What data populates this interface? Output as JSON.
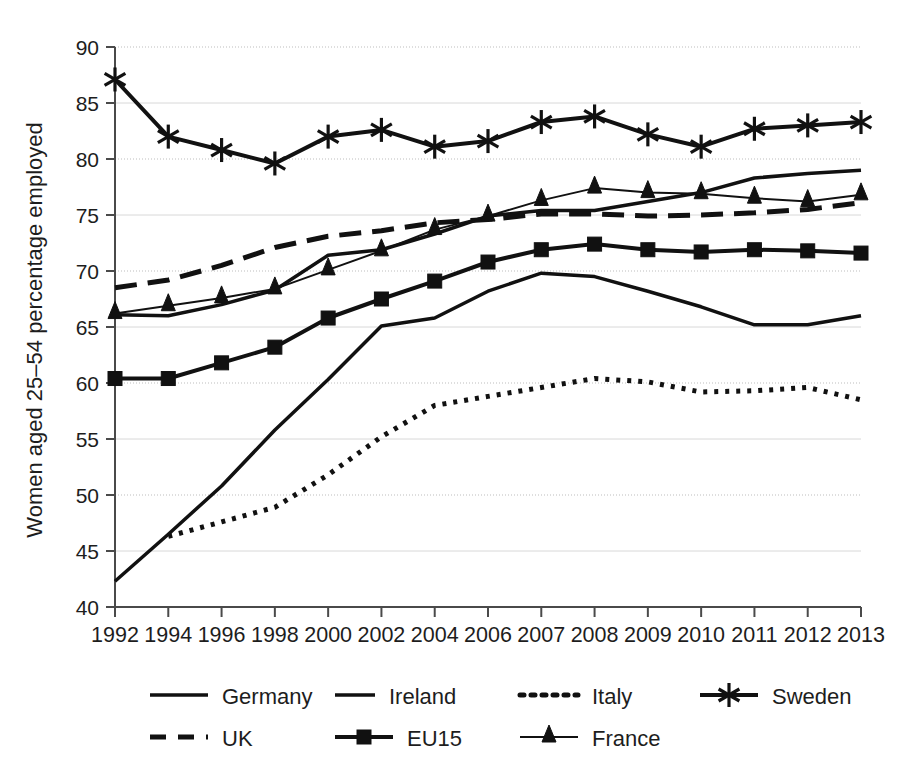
{
  "chart_data": {
    "type": "line",
    "title": "",
    "xlabel": "",
    "ylabel": "Women aged 25–54  percentage employed",
    "ylim": [
      40,
      90
    ],
    "ytick_step": 5,
    "yticks": [
      40,
      45,
      50,
      55,
      60,
      65,
      70,
      75,
      80,
      85,
      90
    ],
    "grid": true,
    "legend_position": "bottom",
    "categories": [
      "1992",
      "1994",
      "1996",
      "1998",
      "2000",
      "2002",
      "2004",
      "2006",
      "2007",
      "2008",
      "2009",
      "2010",
      "2011",
      "2012",
      "2013"
    ],
    "series": [
      {
        "name": "Germany",
        "style": "solid",
        "marker": "none",
        "values": [
          66.1,
          66.0,
          67.0,
          68.3,
          71.4,
          71.9,
          73.3,
          74.9,
          75.4,
          75.4,
          76.2,
          77.0,
          78.3,
          78.7,
          79.0
        ]
      },
      {
        "name": "Ireland",
        "style": "solid",
        "marker": "none",
        "values": [
          42.3,
          46.5,
          50.8,
          55.8,
          60.3,
          65.1,
          65.8,
          68.2,
          69.8,
          69.5,
          68.2,
          66.8,
          65.2,
          65.2,
          66.0
        ]
      },
      {
        "name": "Italy",
        "style": "dotted",
        "marker": "none",
        "values": [
          null,
          46.3,
          47.6,
          48.9,
          51.8,
          55.2,
          58.0,
          58.8,
          59.6,
          60.4,
          60.1,
          59.2,
          59.3,
          59.6,
          58.5
        ]
      },
      {
        "name": "Sweden",
        "style": "solid",
        "marker": "asterisk",
        "values": [
          87.1,
          82.0,
          80.8,
          79.6,
          82.0,
          82.6,
          81.1,
          81.6,
          83.3,
          83.8,
          82.2,
          81.1,
          82.7,
          83.0,
          83.3
        ]
      },
      {
        "name": "UK",
        "style": "dashed",
        "marker": "none",
        "values": [
          68.5,
          69.2,
          70.5,
          72.1,
          73.1,
          73.6,
          74.3,
          74.6,
          75.1,
          75.1,
          74.9,
          75.0,
          75.2,
          75.5,
          76.1
        ]
      },
      {
        "name": "EU15",
        "style": "solid",
        "marker": "square",
        "values": [
          60.4,
          60.4,
          61.8,
          63.2,
          65.8,
          67.5,
          69.1,
          70.8,
          71.9,
          72.4,
          71.9,
          71.7,
          71.9,
          71.8,
          71.6
        ]
      },
      {
        "name": "France",
        "style": "solid",
        "marker": "triangle",
        "values": [
          66.2,
          66.9,
          67.6,
          68.4,
          70.1,
          71.8,
          73.7,
          74.9,
          76.3,
          77.4,
          77.0,
          76.9,
          76.5,
          76.2,
          76.8
        ]
      }
    ],
    "legend_entries": [
      {
        "label": "Germany",
        "style": "solid",
        "marker": "none"
      },
      {
        "label": "Ireland",
        "style": "solid",
        "marker": "none"
      },
      {
        "label": "Italy",
        "style": "dotted",
        "marker": "none"
      },
      {
        "label": "Sweden",
        "style": "solid",
        "marker": "asterisk"
      },
      {
        "label": "UK",
        "style": "dashed",
        "marker": "none"
      },
      {
        "label": "EU15",
        "style": "solid",
        "marker": "square"
      },
      {
        "label": "France",
        "style": "solid",
        "marker": "triangle"
      }
    ],
    "colors": {
      "ink": "#111111",
      "axis": "#4a4a4a",
      "grid": "#d8d8d8",
      "background": "#ffffff"
    }
  }
}
